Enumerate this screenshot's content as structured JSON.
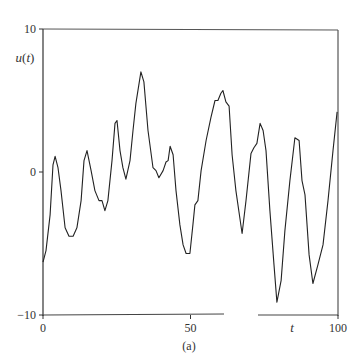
{
  "chart_data": {
    "type": "line",
    "title": "",
    "caption": "(a)",
    "xlabel": "t",
    "ylabel": "u(t)",
    "xlim": [
      0,
      100
    ],
    "ylim": [
      -10,
      10
    ],
    "x_ticks": [
      0,
      50,
      100
    ],
    "x_tick_labels": [
      "0",
      "50",
      "100"
    ],
    "y_ticks": [
      -10,
      0,
      10
    ],
    "y_tick_labels": [
      "-10",
      "0",
      "10"
    ],
    "grid": false,
    "legend": null,
    "series": [
      {
        "name": "u(t)",
        "color": "#222222",
        "x": [
          0,
          1,
          2.4,
          3.4,
          4.1,
          5.1,
          6.1,
          7.5,
          8.8,
          10.2,
          11.5,
          12.9,
          13.9,
          14.9,
          16.3,
          17.6,
          19.0,
          20.0,
          21.0,
          22.0,
          23.4,
          24.4,
          25.1,
          26.1,
          27.1,
          28.1,
          29.5,
          30.5,
          31.5,
          33.2,
          34.2,
          35.6,
          37.3,
          38.3,
          39.3,
          40.7,
          41.7,
          42.4,
          43.1,
          44.1,
          45.1,
          46.4,
          47.5,
          48.5,
          49.8,
          50.8,
          51.5,
          52.5,
          53.6,
          55.3,
          56.9,
          58.3,
          59.3,
          60.3,
          61.0,
          62.0,
          63.1,
          64.1,
          65.4,
          67.5,
          68.8,
          70.5,
          71.5,
          72.5,
          73.6,
          74.6,
          75.6,
          76.9,
          78.3,
          79.3,
          80.7,
          82.0,
          83.7,
          85.4,
          86.8,
          87.8,
          88.8,
          90.2,
          91.5,
          93.2,
          94.9,
          96.6,
          98.3,
          99.7
        ],
        "y": [
          -6.3,
          -5.5,
          -3.0,
          0.5,
          1.1,
          0.3,
          -1.3,
          -3.9,
          -4.5,
          -4.5,
          -3.9,
          -2.0,
          0.8,
          1.5,
          0.1,
          -1.3,
          -2.0,
          -2.0,
          -2.7,
          -2.0,
          0.8,
          3.4,
          3.6,
          1.5,
          0.3,
          -0.5,
          0.8,
          2.9,
          4.8,
          7.0,
          6.3,
          2.9,
          0.3,
          0.1,
          -0.4,
          0.1,
          0.7,
          0.8,
          1.8,
          1.2,
          -1.3,
          -3.7,
          -5.1,
          -5.7,
          -5.7,
          -3.7,
          -2.3,
          -2.0,
          0.1,
          2.2,
          3.8,
          5.0,
          5.0,
          5.5,
          5.7,
          4.9,
          4.6,
          1.2,
          -1.3,
          -4.3,
          -2.0,
          1.3,
          1.7,
          2.0,
          3.4,
          2.9,
          1.5,
          -2.7,
          -6.5,
          -9.1,
          -7.6,
          -4.1,
          -0.6,
          2.4,
          2.2,
          -0.6,
          -1.6,
          -5.8,
          -7.8,
          -6.5,
          -5.1,
          -2.0,
          1.5,
          4.2
        ]
      }
    ]
  }
}
